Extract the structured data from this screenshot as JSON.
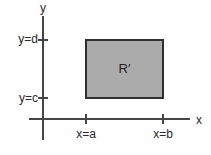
{
  "figure": {
    "y_axis_label": "y",
    "x_axis_label": "x",
    "region_label": "R′",
    "y_ticks": [
      {
        "label": "y=d"
      },
      {
        "label": "y=c"
      }
    ],
    "x_ticks": [
      {
        "label": "x=a"
      },
      {
        "label": "x=b"
      }
    ],
    "colors": {
      "background": "#fefefe",
      "axis": "#454545",
      "text": "#2a2a2a",
      "region_fill": "#ababab",
      "region_border": "#2f2f2f"
    }
  }
}
